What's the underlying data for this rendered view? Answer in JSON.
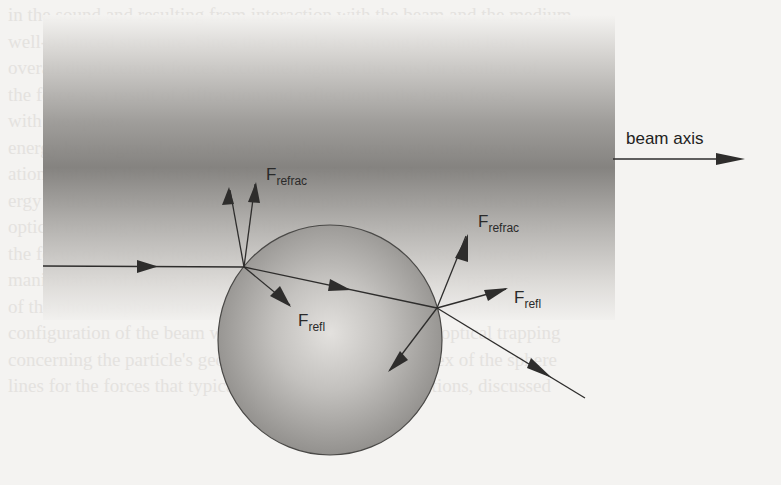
{
  "figure": {
    "labels": {
      "beam_axis": "beam axis",
      "f_refrac_left": "F",
      "f_refrac_left_sub": "refrac",
      "f_refl_left": "F",
      "f_refl_left_sub": "refl",
      "f_refrac_right": "F",
      "f_refrac_right_sub": "refrac",
      "f_refl_right": "F",
      "f_refl_right_sub": "refl"
    },
    "colors": {
      "beam_dark": "#7a7876",
      "beam_light": "#f4f3f1",
      "sphere_edge": "#8d8b88",
      "sphere_center": "#dedcd9",
      "stroke": "#2e2d2c"
    }
  },
  "background_text": {
    "lines": [
      "in the sound and resulting from interaction with the beam and the medium",
      "well-balanced structure. Since the particle is a strong focusing lens it",
      "overall displacement forces accounted against the axis for resultant of",
      "the force as a result of diffraction and reflection in the beam forces",
      "with the sphere",
      "energy be integrated over the whole sphere to arrive at a net force tow",
      "ation that only the focus of the beam, in spite of the dominant con",
      "ergy to the transferred momentum of the photons which strike the surface",
      "optical trapping of the particle in the focus of the beam tends to be stable",
      "the focus of a tightly focused laser beam provides the needed forces for",
      "manipulation of living cells, organelles and other biological particles",
      "of the photon-sphere interaction and the stable trapping region of the",
      "configuration of the beam waist and the resolution is the optical trapping",
      "concerning the particle's geometry and the refractive index of the sphere",
      "lines for the forces that typically are not particular directions, discussed"
    ]
  }
}
